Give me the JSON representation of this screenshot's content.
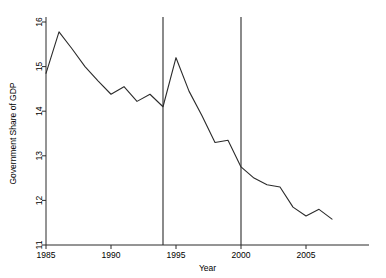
{
  "chart_data": {
    "type": "line",
    "title": "",
    "xlabel": "Year",
    "ylabel": "Government Share of GDP",
    "xlim": [
      1984.3,
      2008.2
    ],
    "ylim": [
      10.8,
      16.3
    ],
    "xticks": [
      1985,
      1990,
      1995,
      2000,
      2005
    ],
    "xticklabels": [
      "1985",
      "1990",
      "1995",
      "2000",
      "2005"
    ],
    "yticks": [
      11,
      12,
      13,
      14,
      15,
      16
    ],
    "yticklabels": [
      "11",
      "12",
      "13",
      "14",
      "15",
      "16"
    ],
    "grid": false,
    "legend": null,
    "line_color": "#2b2b2b",
    "line_width": 1.1,
    "x": [
      1985,
      1986,
      1987,
      1988,
      1989,
      1990,
      1991,
      1992,
      1993,
      1994,
      1995,
      1996,
      1997,
      1998,
      1999,
      2000,
      2001,
      2002,
      2003,
      2004,
      2005,
      2006,
      2007
    ],
    "values": [
      14.85,
      15.78,
      15.4,
      15.0,
      14.68,
      14.38,
      14.55,
      14.22,
      14.38,
      14.1,
      15.2,
      14.45,
      13.9,
      13.3,
      13.35,
      12.75,
      12.5,
      12.35,
      12.3,
      11.85,
      11.65,
      11.8,
      11.58
    ],
    "vlines": [
      {
        "x": 1994,
        "color": "#2b2b2b",
        "label": "1994"
      },
      {
        "x": 2000,
        "color": "#2b2b2b",
        "label": "2000"
      }
    ],
    "axis_color": "#2b2b2b"
  }
}
